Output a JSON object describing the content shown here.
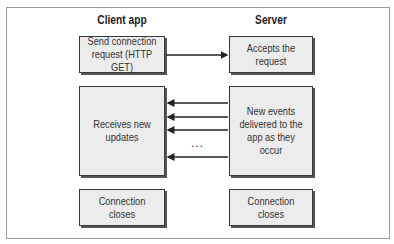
{
  "diagram": {
    "columns": [
      {
        "title": "Client app"
      },
      {
        "title": "Server"
      }
    ],
    "client_boxes": [
      {
        "label": "Send connection request (HTTP GET)"
      },
      {
        "label": "Receives new updates"
      },
      {
        "label": "Connection closes"
      }
    ],
    "server_boxes": [
      {
        "label": "Accepts the request"
      },
      {
        "label": "New events delivered to the app as they occur"
      },
      {
        "label": "Connection closes"
      }
    ],
    "ellipsis": "...",
    "colors": {
      "box_fill": "#ececec",
      "box_border": "#3a3a3a",
      "frame": "#9a9a9a"
    }
  }
}
